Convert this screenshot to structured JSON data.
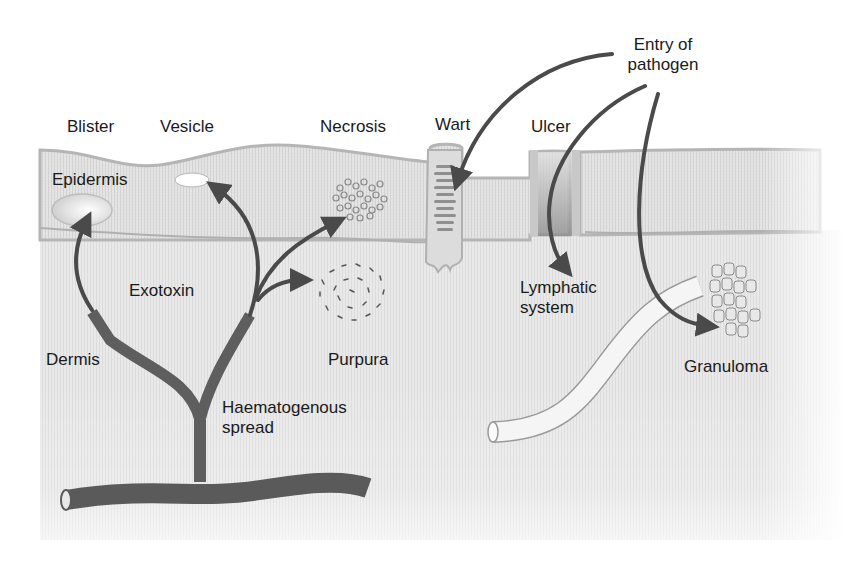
{
  "colors": {
    "epidermis": "#e4e4e4",
    "epidermis_border": "#b5b5b5",
    "dermis": "#ececec",
    "arrow": "#4a4a4a",
    "vessel": "#5c5c5c",
    "lymphatic": "#f4f4f4",
    "text": "#1a1a1a"
  },
  "labels": {
    "blister": "Blister",
    "vesicle": "Vesicle",
    "necrosis": "Necrosis",
    "wart": "Wart",
    "ulcer": "Ulcer",
    "entry_line1": "Entry of",
    "entry_line2": "pathogen",
    "epidermis": "Epidermis",
    "exotoxin": "Exotoxin",
    "dermis": "Dermis",
    "purpura": "Purpura",
    "lymphatic_line1": "Lymphatic",
    "lymphatic_line2": "system",
    "granuloma": "Granuloma",
    "haem_line1": "Haematogenous",
    "haem_line2": "spread"
  },
  "layers": [
    "Epidermis",
    "Dermis"
  ],
  "lesions": [
    "Blister",
    "Vesicle",
    "Necrosis",
    "Purpura",
    "Wart",
    "Ulcer",
    "Granuloma"
  ],
  "routes": [
    "Entry of pathogen",
    "Exotoxin",
    "Haematogenous spread",
    "Lymphatic system"
  ]
}
